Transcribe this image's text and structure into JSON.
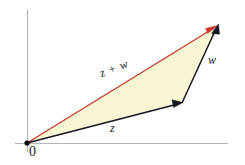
{
  "diagram": {
    "background_color": "#ffffff",
    "fill_color": "#f8f5d4",
    "axis_color": "#b0b0b8",
    "vector_color": "#161620",
    "sum_color": "#c0392b",
    "origin_dot_color": "#000000",
    "labels": {
      "sum": "z + w",
      "vector_w": "w",
      "vector_z": "z",
      "origin": "0"
    },
    "points": {
      "origin": {
        "x": 27,
        "y": 143
      },
      "z_tip": {
        "x": 182,
        "y": 103
      },
      "sum_tip": {
        "x": 218,
        "y": 26
      }
    },
    "axes": {
      "x_axis": {
        "x1": 15,
        "y1": 143,
        "x2": 228,
        "y2": 143
      },
      "y_axis": {
        "x1": 27,
        "y1": 10,
        "x2": 27,
        "y2": 152
      }
    },
    "icons": {
      "arrowhead_z": "arrowhead-icon",
      "arrowhead_w": "arrowhead-icon",
      "arrowhead_sum": "arrowhead-icon"
    }
  }
}
